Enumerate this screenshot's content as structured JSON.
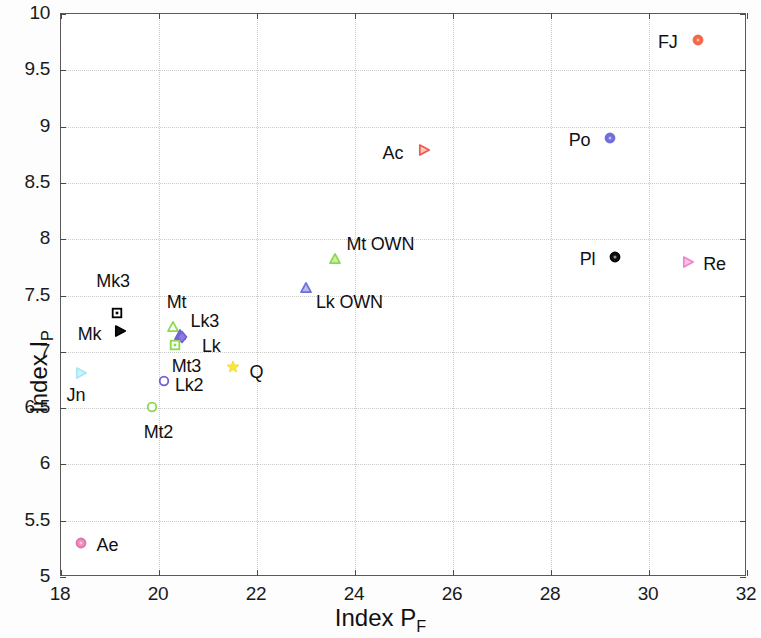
{
  "chart_data": {
    "type": "scatter",
    "title": "",
    "xlabel": "Index P_F",
    "xlabel_main": "Index P",
    "xlabel_sub": "F",
    "ylabel": "Index I_P",
    "ylabel_main": "Index I",
    "ylabel_sub": "P",
    "xlim": [
      18,
      32
    ],
    "ylim": [
      5,
      10
    ],
    "xticks": [
      18,
      20,
      22,
      24,
      26,
      28,
      30,
      32
    ],
    "xticklabels": [
      "18",
      "20",
      "22",
      "24",
      "26",
      "28",
      "30",
      "32"
    ],
    "yticks": [
      5,
      5.5,
      6,
      6.5,
      7,
      7.5,
      8,
      8.5,
      9,
      9.5,
      10
    ],
    "yticklabels": [
      "5",
      "5.5",
      "6",
      "6.5",
      "7",
      "7.5",
      "8",
      "8.5",
      "9",
      "9.5",
      "10"
    ],
    "grid": true,
    "grid_style": "dotted",
    "legend": "none",
    "points": [
      {
        "label": "FJ",
        "x": 31.0,
        "y": 9.75,
        "marker": "circle",
        "color": "#f4694a",
        "fill": "#f4694a",
        "label_dx": -40,
        "label_dy": -10
      },
      {
        "label": "Po",
        "x": 29.2,
        "y": 8.88,
        "marker": "circle",
        "color": "#6f6fdb",
        "fill": "#6f6fdb",
        "label_dx": -41,
        "label_dy": -10
      },
      {
        "label": "Ac",
        "x": 25.4,
        "y": 8.77,
        "marker": "triangle-right",
        "color": "#f0574a",
        "fill": "#ffc9bd",
        "label_dx": -41,
        "label_dy": -9
      },
      {
        "label": "Mt OWN",
        "x": 23.6,
        "y": 7.81,
        "marker": "triangle-up",
        "color": "#8bd94a",
        "fill": "#c8f0a0",
        "label_dx": 11,
        "label_dy": -27
      },
      {
        "label": "Pl",
        "x": 29.3,
        "y": 7.82,
        "marker": "circle",
        "color": "#000000",
        "fill": "#111111",
        "label_dx": -35,
        "label_dy": -10
      },
      {
        "label": "Re",
        "x": 30.8,
        "y": 7.78,
        "marker": "triangle-right",
        "color": "#ef85cc",
        "fill": "#f9c4e4",
        "label_dx": 15,
        "label_dy": -10
      },
      {
        "label": "Lk OWN",
        "x": 23.0,
        "y": 7.55,
        "marker": "triangle-up",
        "color": "#6f6fdb",
        "fill": "#b9b9ee",
        "label_dx": 10,
        "label_dy": 2
      },
      {
        "label": "Mk3",
        "x": 19.15,
        "y": 7.33,
        "marker": "square",
        "color": "#000000",
        "fill": "#ffffff",
        "label_dx": -21,
        "label_dy": -44
      },
      {
        "label": "Mt",
        "x": 20.28,
        "y": 7.2,
        "marker": "triangle-up",
        "color": "#8bd94a",
        "fill": "#ffffff",
        "label_dx": -6,
        "label_dy": -37
      },
      {
        "label": "Mk",
        "x": 19.2,
        "y": 7.17,
        "marker": "triangle-right",
        "color": "#000000",
        "fill": "#111111",
        "label_dx": -42,
        "label_dy": -9
      },
      {
        "label": "Lk3",
        "x": 20.42,
        "y": 7.13,
        "marker": "triangle-up",
        "color": "#6f5fd6",
        "fill": "#8a7ae0",
        "label_dx": 11,
        "label_dy": -26
      },
      {
        "label": "Lk",
        "x": 20.47,
        "y": 7.11,
        "marker": "diamond",
        "color": "#6f5fd6",
        "fill": "#8a7ae0",
        "label_dx": 20,
        "label_dy": -3
      },
      {
        "label": "Mt3",
        "x": 20.32,
        "y": 7.04,
        "marker": "square",
        "color": "#8bd94a",
        "fill": "#ffffff",
        "label_dx": -3,
        "label_dy": 9
      },
      {
        "label": "Q",
        "x": 21.5,
        "y": 6.85,
        "marker": "pentagram",
        "color": "#f5e03c",
        "fill": "#f7e63f",
        "label_dx": 17,
        "label_dy": -7
      },
      {
        "label": "Jn",
        "x": 18.4,
        "y": 6.79,
        "marker": "triangle-right",
        "color": "#a8e6f5",
        "fill": "#cdf2fa",
        "label_dx": -14,
        "label_dy": 10
      },
      {
        "label": "Lk2",
        "x": 20.1,
        "y": 6.72,
        "marker": "circle-open",
        "color": "#6f5fd6",
        "fill": "#ffffff",
        "label_dx": 11,
        "label_dy": -8
      },
      {
        "label": "Mt2",
        "x": 19.85,
        "y": 6.49,
        "marker": "circle-open",
        "color": "#8bd94a",
        "fill": "#ffffff",
        "label_dx": -8,
        "label_dy": 13
      },
      {
        "label": "Ae",
        "x": 18.4,
        "y": 5.28,
        "marker": "circle",
        "color": "#e36fa8",
        "fill": "#ec8dbc",
        "label_dx": 16,
        "label_dy": -10
      }
    ]
  }
}
